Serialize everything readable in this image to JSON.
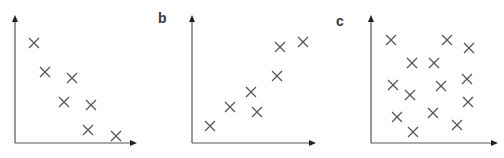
{
  "figure": {
    "panels": [
      {
        "label": "b"
      },
      {
        "label": "c"
      }
    ]
  },
  "colors": {
    "axis": "#555555",
    "marker": "#555555",
    "label": "#3a3a3a"
  },
  "chart_data": [
    {
      "type": "scatter",
      "panel": "a",
      "title": "",
      "xlabel": "",
      "ylabel": "",
      "marker": "x",
      "grid": false,
      "description": "negative correlation",
      "points_px": [
        [
          34,
          43
        ],
        [
          45,
          72
        ],
        [
          72,
          78
        ],
        [
          64,
          102
        ],
        [
          91,
          105
        ],
        [
          88,
          130
        ],
        [
          116,
          136
        ]
      ],
      "axes_px": {
        "origin": [
          15,
          143
        ],
        "x_end": 137,
        "y_top": 15
      }
    },
    {
      "type": "scatter",
      "panel": "b",
      "title": "",
      "xlabel": "",
      "ylabel": "",
      "marker": "x",
      "grid": false,
      "description": "positive correlation",
      "points_px": [
        [
          210,
          126
        ],
        [
          230,
          107
        ],
        [
          251,
          92
        ],
        [
          257,
          112
        ],
        [
          277,
          76
        ],
        [
          280,
          47
        ],
        [
          303,
          42
        ]
      ],
      "axes_px": {
        "origin": [
          192,
          143
        ],
        "x_end": 316,
        "y_top": 15
      }
    },
    {
      "type": "scatter",
      "panel": "c",
      "title": "",
      "xlabel": "",
      "ylabel": "",
      "marker": "x",
      "grid": false,
      "description": "no correlation",
      "points_px": [
        [
          391,
          40
        ],
        [
          447,
          40
        ],
        [
          469,
          48
        ],
        [
          412,
          63
        ],
        [
          434,
          63
        ],
        [
          467,
          79
        ],
        [
          393,
          85
        ],
        [
          410,
          95
        ],
        [
          441,
          86
        ],
        [
          468,
          102
        ],
        [
          397,
          117
        ],
        [
          433,
          113
        ],
        [
          457,
          125
        ],
        [
          413,
          132
        ]
      ],
      "axes_px": {
        "origin": [
          371,
          143
        ],
        "x_end": 498,
        "y_top": 15
      }
    }
  ]
}
